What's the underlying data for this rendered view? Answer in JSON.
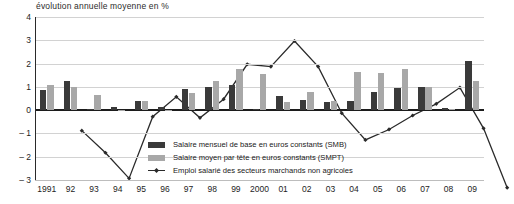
{
  "subtitle": "évolution annuelle moyenne en %",
  "legend": {
    "items": [
      {
        "key": "smb",
        "label": "Salaire mensuel de base en euros constants (SMB)",
        "color": "#3a3a3a",
        "marker": "bar"
      },
      {
        "key": "smpt",
        "label": "Salaire moyen par tête en euros constants (SMPT)",
        "color": "#a8a8a8",
        "marker": "bar"
      },
      {
        "key": "emploi",
        "label": "Emploi salarié des secteurs marchands non agricoles",
        "color": "#2a2a2a",
        "marker": "line"
      }
    ]
  },
  "chart_data": {
    "type": "bar",
    "title": "",
    "subtitle": "évolution annuelle moyenne en %",
    "xlabel": "",
    "ylabel": "",
    "ylim": [
      -3,
      4
    ],
    "yticks": [
      4,
      3,
      2,
      1,
      0,
      -1,
      -2,
      -3
    ],
    "ytick_labels": [
      "4",
      "3",
      "2",
      "1",
      "0",
      "– 1",
      "– 2",
      "– 3"
    ],
    "grid": true,
    "legend_position": "bottom-center",
    "categories": [
      "1991",
      "92",
      "93",
      "94",
      "95",
      "96",
      "97",
      "98",
      "99",
      "2000",
      "01",
      "02",
      "03",
      "04",
      "05",
      "06",
      "07",
      "08",
      "09"
    ],
    "series": [
      {
        "name": "Salaire mensuel de base en euros constants (SMB)",
        "short": "SMB",
        "type": "bar",
        "color": "#3a3a3a",
        "values": [
          0.85,
          1.25,
          0.05,
          0.15,
          0.4,
          0.15,
          0.9,
          1.0,
          1.1,
          0.05,
          0.6,
          0.45,
          0.35,
          0.4,
          0.8,
          0.95,
          1.0,
          0.1,
          2.1
        ]
      },
      {
        "name": "Salaire moyen par tête en euros constants (SMPT)",
        "short": "SMPT",
        "type": "bar",
        "color": "#a8a8a8",
        "values": [
          1.1,
          1.0,
          0.65,
          0.0,
          0.4,
          0.0,
          0.75,
          1.25,
          1.75,
          1.55,
          0.35,
          0.8,
          0.4,
          1.65,
          1.6,
          1.75,
          1.0,
          0.05,
          1.25
        ]
      },
      {
        "name": "Emploi salarié des secteurs marchands non agricoles",
        "short": "Emploi",
        "type": "line",
        "color": "#2a2a2a",
        "marker": "diamond",
        "values": [
          -0.15,
          -1.1,
          -2.2,
          0.45,
          1.3,
          0.4,
          1.2,
          2.7,
          2.6,
          3.7,
          2.6,
          0.6,
          -0.55,
          -0.1,
          0.5,
          1.0,
          1.7,
          -0.05,
          -2.6
        ]
      }
    ]
  }
}
